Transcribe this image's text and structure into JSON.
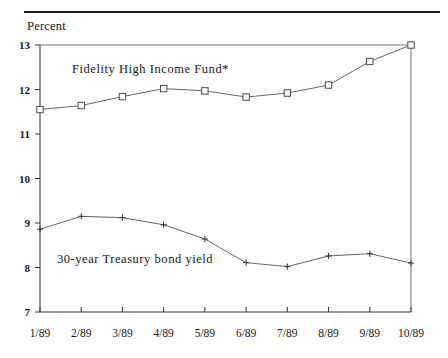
{
  "figure": {
    "axis_label_y": "Percent",
    "top_rule": true
  },
  "chart_data": {
    "type": "line",
    "title": "",
    "xlabel": "",
    "ylabel": "Percent",
    "ylim": [
      7,
      13
    ],
    "yticks": [
      7,
      8,
      9,
      10,
      11,
      12,
      13
    ],
    "ytick_labels": [
      "7",
      "8",
      "9",
      "10",
      "11",
      "12",
      "13"
    ],
    "grid": false,
    "legend": "inline-annotations",
    "categories": [
      "1/89",
      "2/89",
      "3/89",
      "4/89",
      "5/89",
      "6/89",
      "7/89",
      "8/89",
      "9/89",
      "10/89"
    ],
    "series": [
      {
        "name": "Fidelity High Income Fund*",
        "marker": "open-square",
        "values": [
          11.55,
          11.64,
          11.84,
          12.02,
          11.97,
          11.83,
          11.92,
          12.1,
          12.63,
          13.0
        ]
      },
      {
        "name": "30-year Treasury bond yield",
        "marker": "plus",
        "values": [
          8.86,
          9.15,
          9.12,
          8.96,
          8.64,
          8.11,
          8.02,
          8.26,
          8.31,
          8.1
        ]
      }
    ]
  },
  "annotations": {
    "fund_label": "Fidelity High Income Fund*",
    "treasury_label": "30-year Treasury bond yield"
  }
}
